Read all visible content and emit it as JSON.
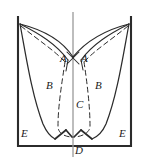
{
  "figure": {
    "type": "line-diagram",
    "width": 146,
    "height": 163,
    "background_color": "#ffffff",
    "stroke_color": "#2b2b2b",
    "centerline_color": "#9a9a9a",
    "labels": [
      {
        "id": "A-left",
        "text": "A",
        "x": 60,
        "y": 58
      },
      {
        "id": "A-right",
        "text": "A",
        "x": 81,
        "y": 58
      },
      {
        "id": "B-left",
        "text": "B",
        "x": 46,
        "y": 85
      },
      {
        "id": "B-right",
        "text": "B",
        "x": 95,
        "y": 85
      },
      {
        "id": "C",
        "text": "C",
        "x": 76,
        "y": 104
      },
      {
        "id": "D",
        "text": "D",
        "x": 75,
        "y": 150
      },
      {
        "id": "E-left",
        "text": "E",
        "x": 21,
        "y": 133
      },
      {
        "id": "E-right",
        "text": "E",
        "x": 119,
        "y": 133
      }
    ],
    "geometry": {
      "container": {
        "left_wall_x": 18,
        "right_wall_x": 131,
        "top_y": 17,
        "bottom_y": 146
      },
      "centerline": {
        "x": 73,
        "top_y": 12,
        "bottom_y": 157
      },
      "apex_point": {
        "x": 73,
        "y": 57
      },
      "bottom_point_D": {
        "x": 73,
        "y": 137
      },
      "notch_left_x": 55,
      "notch_right_x": 91
    }
  }
}
